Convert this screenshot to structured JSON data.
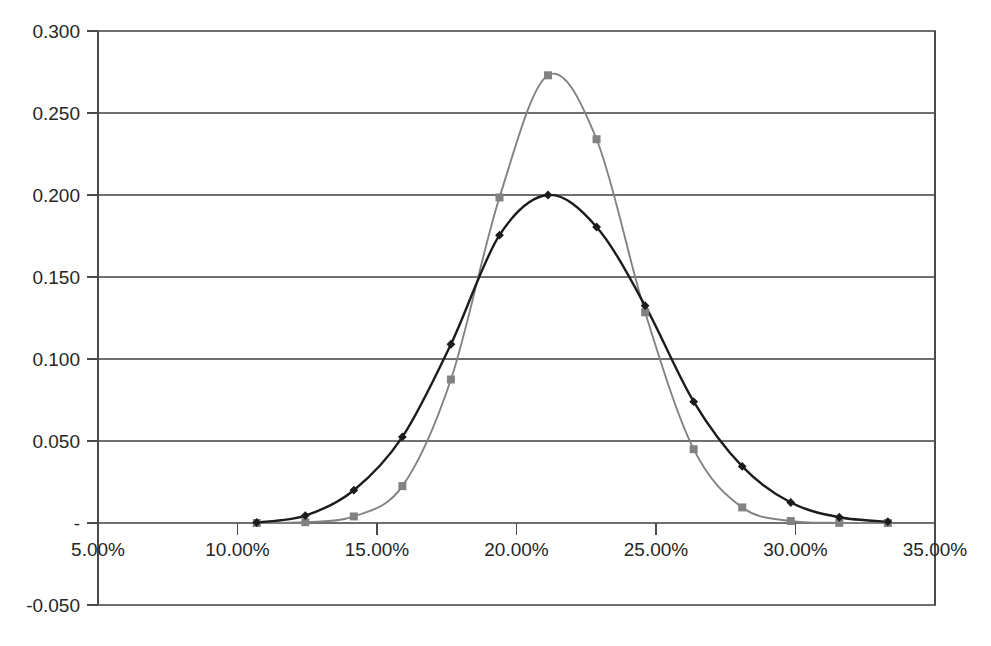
{
  "chart_data": {
    "type": "line",
    "title": "",
    "subtitle": "",
    "xlabel": "",
    "ylabel": "",
    "xlim": [
      0.05,
      0.35
    ],
    "ylim": [
      -0.05,
      0.3
    ],
    "grid": true,
    "legend": "none",
    "x_tick_labels": [
      "5.00%",
      "10.00%",
      "15.00%",
      "20.00%",
      "25.00%",
      "30.00%",
      "35.00%"
    ],
    "x_tick_values": [
      0.05,
      0.1,
      0.15,
      0.2,
      0.25,
      0.3,
      0.35
    ],
    "y_tick_labels": [
      "0.300",
      "0.250",
      "0.200",
      "0.150",
      "0.100",
      "0.050",
      "-",
      "-0.050"
    ],
    "y_tick_values": [
      0.3,
      0.25,
      0.2,
      0.15,
      0.1,
      0.05,
      0.0,
      -0.05
    ],
    "x": [
      0.1069,
      0.1243,
      0.1417,
      0.1591,
      0.1765,
      0.1939,
      0.2113,
      0.2287,
      0.2461,
      0.2635,
      0.2809,
      0.2983,
      0.3157,
      0.3331
    ],
    "series": [
      {
        "name": "series-1",
        "marker": "diamond",
        "color": "#1c1c1c",
        "values": [
          0.0003,
          0.0045,
          0.02,
          0.0525,
          0.109,
          0.1755,
          0.2,
          0.1805,
          0.1325,
          0.074,
          0.0345,
          0.0125,
          0.0035,
          0.0008
        ]
      },
      {
        "name": "series-2",
        "marker": "square",
        "color": "#828282",
        "values": [
          0.0,
          0.0005,
          0.004,
          0.0225,
          0.0875,
          0.1985,
          0.273,
          0.234,
          0.1285,
          0.045,
          0.0095,
          0.0012,
          0.0001,
          0.0
        ]
      }
    ]
  },
  "geometry": {
    "plot_left": 98,
    "plot_right": 935,
    "plot_top": 31,
    "plot_bottom": 605,
    "zero_y": 523,
    "px_per_unit_y": 1638,
    "px_per_unit_x": 2790
  }
}
